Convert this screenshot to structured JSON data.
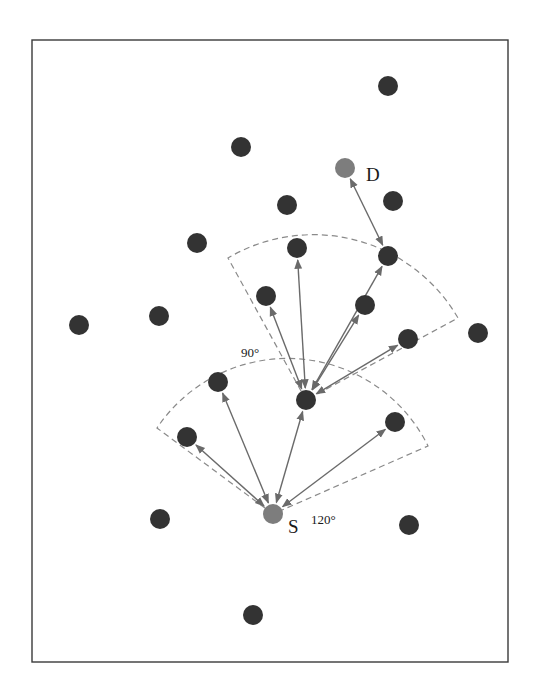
{
  "diagram": {
    "type": "network-routing",
    "frame": {
      "x": 32,
      "y": 40,
      "width": 476,
      "height": 622
    },
    "colors": {
      "node": "#333333",
      "special_node": "#7d7d7d",
      "link": "#6a6a6a",
      "sector": "#8a8a8a",
      "frame": "#3a3a3a"
    },
    "labels": {
      "source": "S",
      "destination": "D",
      "sector_source_angle": "120°",
      "sector_relay_angle": "90°"
    },
    "source": {
      "id": "S",
      "x": 273,
      "y": 514,
      "r": 10
    },
    "destination": {
      "id": "D",
      "x": 345,
      "y": 168,
      "r": 10
    },
    "relay": {
      "x": 306,
      "y": 400
    },
    "nodes": [
      {
        "x": 388,
        "y": 86
      },
      {
        "x": 241,
        "y": 147
      },
      {
        "x": 393,
        "y": 201
      },
      {
        "x": 287,
        "y": 205
      },
      {
        "x": 197,
        "y": 243
      },
      {
        "x": 297,
        "y": 248
      },
      {
        "x": 388,
        "y": 256
      },
      {
        "x": 266,
        "y": 296
      },
      {
        "x": 365,
        "y": 305
      },
      {
        "x": 159,
        "y": 316
      },
      {
        "x": 79,
        "y": 325
      },
      {
        "x": 408,
        "y": 339
      },
      {
        "x": 478,
        "y": 333
      },
      {
        "x": 218,
        "y": 382
      },
      {
        "x": 306,
        "y": 400
      },
      {
        "x": 187,
        "y": 437
      },
      {
        "x": 395,
        "y": 422
      },
      {
        "x": 160,
        "y": 519
      },
      {
        "x": 409,
        "y": 525
      },
      {
        "x": 253,
        "y": 615
      }
    ],
    "links": [
      {
        "from": [
          273,
          514
        ],
        "to": [
          187,
          437
        ]
      },
      {
        "from": [
          273,
          514
        ],
        "to": [
          218,
          382
        ]
      },
      {
        "from": [
          273,
          514
        ],
        "to": [
          306,
          400
        ]
      },
      {
        "from": [
          273,
          514
        ],
        "to": [
          395,
          422
        ]
      },
      {
        "from": [
          306,
          400
        ],
        "to": [
          266,
          296
        ]
      },
      {
        "from": [
          306,
          400
        ],
        "to": [
          297,
          248
        ]
      },
      {
        "from": [
          306,
          400
        ],
        "to": [
          365,
          305
        ]
      },
      {
        "from": [
          306,
          400
        ],
        "to": [
          388,
          256
        ]
      },
      {
        "from": [
          306,
          400
        ],
        "to": [
          408,
          339
        ]
      },
      {
        "from": [
          388,
          256
        ],
        "to": [
          345,
          168
        ]
      }
    ],
    "sectors": [
      {
        "apex": [
          273,
          514
        ],
        "angle_deg": 120,
        "left": [
          157,
          428
        ],
        "right": [
          428,
          446
        ],
        "top": [
          285,
          365
        ]
      },
      {
        "apex": [
          306,
          400
        ],
        "angle_deg": 90,
        "left": [
          228,
          258
        ],
        "right": [
          458,
          318
        ],
        "top": [
          300,
          234
        ]
      }
    ]
  }
}
